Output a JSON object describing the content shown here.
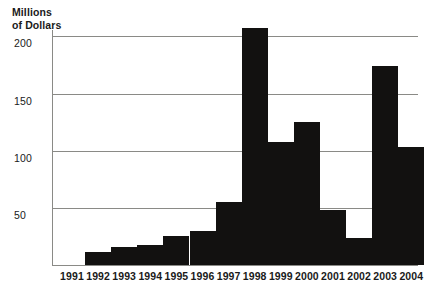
{
  "chart_data": {
    "type": "bar",
    "title": "",
    "subtitle": "",
    "xlabel": "",
    "ylabel": "Millions of Dollars",
    "ylabel_lines": [
      "Millions",
      "of Dollars"
    ],
    "categories": [
      "1991",
      "1992",
      "1993",
      "1994",
      "1995",
      "1996",
      "1997",
      "1998",
      "1999",
      "2000",
      "2001",
      "2002",
      "2003",
      "2004"
    ],
    "values": [
      0,
      11,
      15,
      17,
      25,
      29,
      54,
      203,
      105,
      122,
      47,
      23,
      170,
      101
    ],
    "ylim": [
      0,
      201
    ],
    "yticks": [
      50,
      100,
      150,
      200
    ],
    "ytick_labels": [
      "50",
      "100",
      "150",
      "200"
    ],
    "grid": true,
    "grid_axis": "y",
    "legend": false,
    "legend_position": "none",
    "bar_color": "#121110",
    "grid_color": "#8a8a86",
    "background_color": "#ffffff",
    "text_color": "#1a1a1a"
  }
}
